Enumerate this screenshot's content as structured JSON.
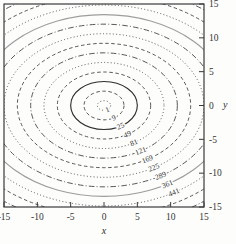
{
  "figure": {
    "background": "#fdfdfc",
    "box_color": "#3a3a3a",
    "tick_color": "#3a3a3a",
    "default_line_color": "#4e4e4e",
    "label_color": "#333333"
  },
  "chart_data": {
    "type": "contour",
    "title": "",
    "xlabel": "x",
    "ylabel": "y",
    "xlim": [
      -15,
      15
    ],
    "ylim": [
      -15,
      15
    ],
    "xticks": [
      -15,
      -10,
      -5,
      0,
      5,
      10,
      15
    ],
    "yticks": [
      15,
      10,
      5,
      0,
      -5,
      -10,
      -15
    ],
    "grid": false,
    "legend": "none",
    "contour_labels": [
      "1",
      "9",
      "25",
      "49",
      "81",
      "121",
      "169",
      "225",
      "289",
      "361",
      "441"
    ],
    "contours": [
      {
        "level": 1,
        "rx": 1.0,
        "ry": 0.71,
        "style": "dotted",
        "color": "#4e4e4e",
        "labeled": true
      },
      {
        "level": 9,
        "rx": 3.0,
        "ry": 2.12,
        "style": "dashed",
        "color": "#4e4e4e",
        "labeled": true
      },
      {
        "level": 25,
        "rx": 5.0,
        "ry": 3.54,
        "style": "solid",
        "color": "#2e2e2e",
        "labeled": true
      },
      {
        "level": 49,
        "rx": 7.0,
        "ry": 4.95,
        "style": "dashed",
        "color": "#4e4e4e",
        "labeled": true
      },
      {
        "level": 81,
        "rx": 9.0,
        "ry": 6.36,
        "style": "dotted",
        "color": "#4e4e4e",
        "labeled": true
      },
      {
        "level": 121,
        "rx": 11.0,
        "ry": 7.78,
        "style": "dashdot",
        "color": "#4e4e4e",
        "labeled": true
      },
      {
        "level": 169,
        "rx": 13.0,
        "ry": 9.19,
        "style": "dashed",
        "color": "#4e4e4e",
        "labeled": true
      },
      {
        "level": 225,
        "rx": 15.0,
        "ry": 10.61,
        "style": "dotted",
        "color": "#4e4e4e",
        "labeled": true
      },
      {
        "level": 289,
        "rx": 17.0,
        "ry": 12.02,
        "style": "dashdot",
        "color": "#4e4e4e",
        "labeled": true
      },
      {
        "level": 361,
        "rx": 19.0,
        "ry": 13.44,
        "style": "solid",
        "color": "#9d9d9d",
        "labeled": true
      },
      {
        "level": 441,
        "rx": 21.0,
        "ry": 14.85,
        "style": "dotted",
        "color": "#4e4e4e",
        "labeled": true
      },
      {
        "level": 529,
        "rx": 23.0,
        "ry": 16.26,
        "style": "dashed",
        "color": "#4e4e4e",
        "labeled": false
      },
      {
        "level": 625,
        "rx": 25.0,
        "ry": 17.68,
        "style": "dashdot",
        "color": "#4e4e4e",
        "labeled": false
      }
    ]
  }
}
